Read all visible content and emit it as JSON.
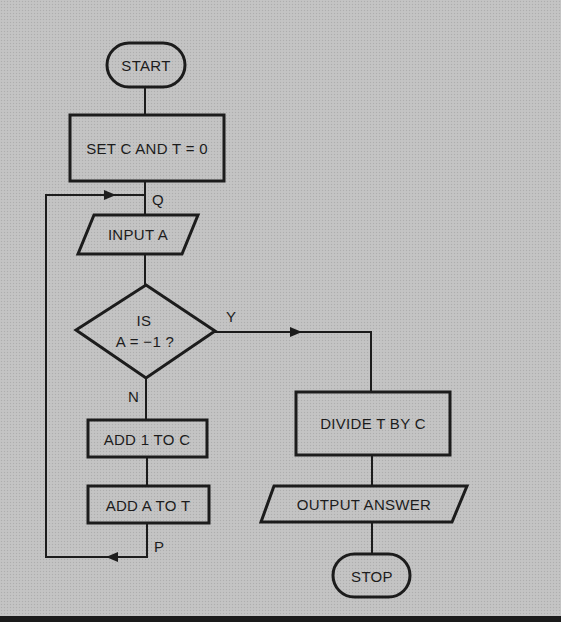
{
  "diagram": {
    "type": "flowchart",
    "nodes": {
      "start": {
        "shape": "terminal",
        "label": "START"
      },
      "init": {
        "shape": "process",
        "label": "SET C AND T = 0"
      },
      "input": {
        "shape": "input-output",
        "label": "INPUT A"
      },
      "decision": {
        "shape": "decision",
        "label_line1": "IS",
        "label_line2": "A = −1 ?"
      },
      "add_c": {
        "shape": "process",
        "label": "ADD 1 TO C"
      },
      "add_t": {
        "shape": "process",
        "label": "ADD A TO T"
      },
      "divide": {
        "shape": "process",
        "label": "DIVIDE T BY C"
      },
      "output": {
        "shape": "input-output",
        "label": "OUTPUT ANSWER"
      },
      "stop": {
        "shape": "terminal",
        "label": "STOP"
      }
    },
    "connector_labels": {
      "q": "Q",
      "p": "P",
      "yes": "Y",
      "no": "N"
    },
    "edges": [
      {
        "from": "start",
        "to": "init"
      },
      {
        "from": "init",
        "to": "input",
        "via": "Q"
      },
      {
        "from": "input",
        "to": "decision"
      },
      {
        "from": "decision",
        "to": "divide",
        "label": "Y"
      },
      {
        "from": "decision",
        "to": "add_c",
        "label": "N"
      },
      {
        "from": "add_c",
        "to": "add_t"
      },
      {
        "from": "add_t",
        "to": "input",
        "via": "P → Q",
        "kind": "loop"
      },
      {
        "from": "divide",
        "to": "output"
      },
      {
        "from": "output",
        "to": "stop"
      }
    ],
    "colors": {
      "background": "#c2c2c2",
      "ink": "#1c1c1c",
      "page": "#ffffff"
    }
  }
}
